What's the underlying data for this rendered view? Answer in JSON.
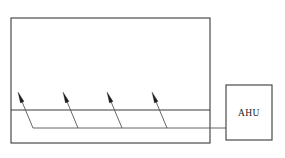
{
  "diagram": {
    "type": "hvac-schematic",
    "stroke_color": "#3a3a3a",
    "thin_stroke_color": "#555555",
    "background_color": "#ffffff",
    "room": {
      "name": "conditioned-space",
      "x": 11,
      "y": 18,
      "width": 199,
      "height": 125,
      "stroke_width": 1.1
    },
    "partition": {
      "name": "ceiling-plenum-line",
      "x1": 11,
      "y1": 110,
      "x2": 210,
      "y2": 110,
      "stroke_width": 1.1
    },
    "supply_duct": {
      "name": "main-supply-duct",
      "x1": 33,
      "y1": 128,
      "x2": 226,
      "y2": 128,
      "stroke_width": 0.9
    },
    "branches": [
      {
        "label": "branch-1",
        "tip_x": 18,
        "tip_y": 92,
        "base_x": 33,
        "base_y": 128
      },
      {
        "label": "branch-2",
        "tip_x": 63,
        "tip_y": 92,
        "base_x": 78,
        "base_y": 128
      },
      {
        "label": "branch-3",
        "tip_x": 107,
        "tip_y": 92,
        "base_x": 122,
        "base_y": 128
      },
      {
        "label": "branch-4",
        "tip_x": 152,
        "tip_y": 92,
        "base_x": 167,
        "base_y": 128
      }
    ],
    "ahu": {
      "label": "AHU",
      "x": 226,
      "y": 85,
      "width": 46,
      "height": 55,
      "label_x": 249,
      "label_y": 116,
      "stroke_width": 1.1
    }
  }
}
